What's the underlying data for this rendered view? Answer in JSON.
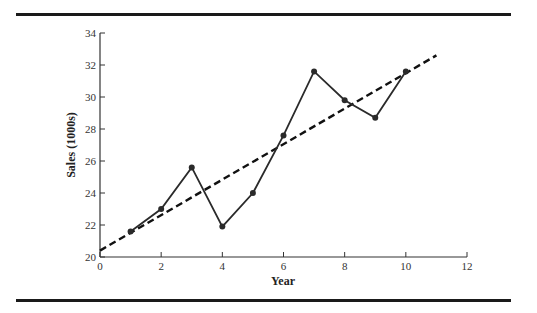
{
  "chart_data": {
    "type": "line",
    "title": "",
    "xlabel": "Year",
    "ylabel": "Sales (1000s)",
    "xlim": [
      0,
      12
    ],
    "ylim": [
      20,
      34
    ],
    "x_ticks": [
      0,
      2,
      4,
      6,
      8,
      10,
      12
    ],
    "y_ticks": [
      20,
      22,
      24,
      26,
      28,
      30,
      32,
      34
    ],
    "grid": false,
    "legend": null,
    "series": [
      {
        "name": "Sales",
        "style": "solid line with markers",
        "x": [
          1,
          2,
          3,
          4,
          5,
          6,
          7,
          8,
          9,
          10
        ],
        "values": [
          21.6,
          23.0,
          25.6,
          21.9,
          24.0,
          27.6,
          31.6,
          29.8,
          28.7,
          31.6
        ]
      },
      {
        "name": "Trend line",
        "style": "dashed",
        "x": [
          0,
          11
        ],
        "values": [
          20.4,
          32.6
        ]
      }
    ]
  },
  "axes": {
    "xlabel": "Year",
    "ylabel": "Sales (1000s)",
    "x_tick_labels": [
      "0",
      "2",
      "4",
      "6",
      "8",
      "10",
      "12"
    ],
    "y_tick_labels": [
      "20",
      "22",
      "24",
      "26",
      "28",
      "30",
      "32",
      "34"
    ]
  },
  "colors": {
    "line": "#2a2a2a",
    "axis": "#333333",
    "rule": "#1a1a1a"
  }
}
